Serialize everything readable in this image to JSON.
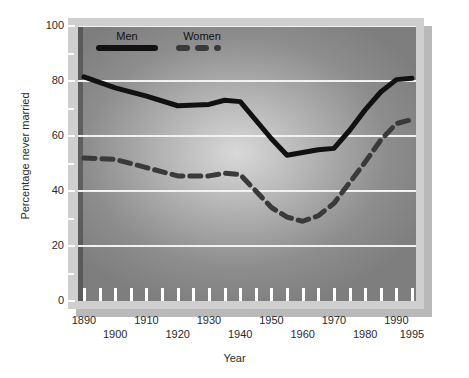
{
  "chart_data": {
    "type": "line",
    "title": "",
    "xlabel": "Year",
    "ylabel": "Percentage never married",
    "xlim": [
      1890,
      1995
    ],
    "ylim": [
      0,
      100
    ],
    "grid": true,
    "legend_position": "top-left",
    "y_ticks": [
      0,
      20,
      40,
      60,
      80,
      100
    ],
    "y_tick_labels": [
      "0",
      "20",
      "40",
      "60",
      "80",
      "100"
    ],
    "x_ticks": [
      1890,
      1900,
      1910,
      1920,
      1930,
      1940,
      1950,
      1960,
      1970,
      1980,
      1990,
      1995
    ],
    "x_tick_labels": [
      "1890",
      "1900",
      "1910",
      "1920",
      "1930",
      "1940",
      "1950",
      "1960",
      "1970",
      "1980",
      "1990",
      "1995"
    ],
    "x_minor_tick_step": 5,
    "x": [
      1890,
      1900,
      1910,
      1920,
      1930,
      1935,
      1940,
      1950,
      1955,
      1960,
      1965,
      1970,
      1975,
      1980,
      1985,
      1990,
      1995
    ],
    "series": [
      {
        "name": "Men",
        "style": "solid",
        "color": "#111111",
        "values": [
          81.5,
          77.5,
          74.5,
          71.0,
          71.5,
          73.0,
          72.5,
          59.0,
          53.0,
          54.0,
          55.0,
          55.5,
          62.0,
          69.5,
          76.0,
          80.5,
          81.0
        ]
      },
      {
        "name": "Women",
        "style": "dashed",
        "color": "#3a3a3a",
        "values": [
          52.0,
          51.5,
          48.5,
          45.5,
          45.5,
          46.5,
          46.0,
          34.0,
          30.5,
          29.0,
          31.0,
          35.5,
          43.0,
          50.5,
          58.5,
          64.5,
          66.0
        ]
      }
    ]
  },
  "legend": {
    "men_label": "Men",
    "women_label": "Women"
  },
  "axes": {
    "x_title": "Year",
    "y_title": "Percentage never married"
  }
}
